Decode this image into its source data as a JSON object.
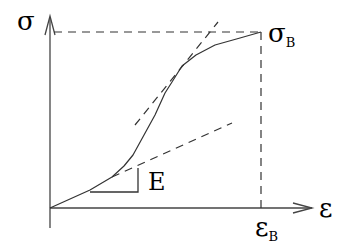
{
  "diagram": {
    "labels": {
      "y_axis": "σ",
      "x_axis": "ε",
      "ultimate_stress": "σ",
      "ultimate_stress_sub": "B",
      "ultimate_strain": "ε",
      "ultimate_strain_sub": "B",
      "modulus": "E"
    },
    "colors": {
      "stroke": "#333333",
      "text": "#000000",
      "background": "#ffffff"
    },
    "geometry": {
      "origin": [
        50,
        208
      ],
      "y_axis_top": [
        50,
        16
      ],
      "y_axis_bottom": [
        50,
        228
      ],
      "x_axis_end": [
        312,
        208
      ],
      "ultimate_point": [
        261,
        32
      ],
      "curve_points": [
        [
          50,
          208
        ],
        [
          90,
          190
        ],
        [
          112,
          177
        ],
        [
          124,
          166
        ],
        [
          133,
          155
        ],
        [
          144,
          135
        ],
        [
          155,
          115
        ],
        [
          165,
          93
        ],
        [
          172,
          82
        ],
        [
          182,
          66
        ],
        [
          196,
          55
        ],
        [
          215,
          45
        ],
        [
          240,
          38
        ],
        [
          261,
          32
        ]
      ],
      "steep_tangent": [
        [
          135,
          125
        ],
        [
          218,
          22
        ]
      ],
      "initial_tangent": [
        [
          112,
          177
        ],
        [
          232,
          123
        ]
      ],
      "slope_triangle": [
        [
          90,
          192
        ],
        [
          138,
          192
        ],
        [
          138,
          168
        ]
      ]
    }
  }
}
